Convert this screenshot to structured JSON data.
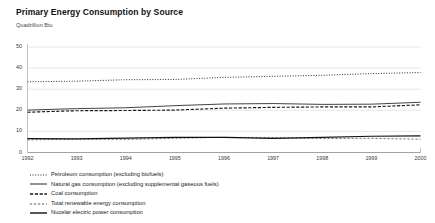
{
  "chart_data": {
    "type": "line",
    "title": "Primary Energy Consumption by Source",
    "subtitle": "Quadrillion Btu",
    "xlabel": "",
    "ylabel": "Quadrillion Btu",
    "ylim": [
      0,
      50
    ],
    "xlim": [
      1992,
      2000
    ],
    "yticks": [
      "0",
      "10",
      "20",
      "30",
      "40",
      "50"
    ],
    "grid": true,
    "legend_position": "bottom-left",
    "x": [
      1992,
      1993,
      1994,
      1995,
      1996,
      1997,
      1998,
      1999,
      2000
    ],
    "series": [
      {
        "name": "Petroleum consumption (excluding biofuels)",
        "style": "dotted",
        "values": [
          33.5,
          33.8,
          34.5,
          34.6,
          35.6,
          36.1,
          36.6,
          37.4,
          37.9
        ]
      },
      {
        "name": "Natural gas consumption (excluding supplemental gaseous fuels)",
        "style": "solid-thin",
        "values": [
          20.1,
          20.8,
          21.2,
          22.2,
          23.0,
          23.2,
          22.8,
          22.9,
          23.8
        ]
      },
      {
        "name": "Coal consumption",
        "style": "dash-dot",
        "values": [
          19.1,
          19.8,
          19.9,
          20.1,
          21.0,
          21.4,
          21.6,
          21.6,
          22.6
        ]
      },
      {
        "name": "Total renewable energy consumption",
        "style": "dashed",
        "values": [
          6.0,
          6.3,
          6.2,
          6.7,
          7.2,
          7.1,
          6.6,
          6.7,
          6.3
        ]
      },
      {
        "name": "Nucelar electric power consumption",
        "style": "solid",
        "values": [
          6.6,
          6.5,
          6.8,
          7.2,
          7.2,
          6.7,
          7.2,
          7.7,
          7.9
        ]
      }
    ]
  }
}
